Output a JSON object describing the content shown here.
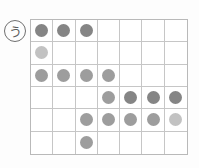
{
  "figure": {
    "label": {
      "text": "う",
      "style": "circled"
    },
    "grid": {
      "columns": 7,
      "rows": 6,
      "border_color": "#b9b9b9",
      "line_color": "#c6c6c6",
      "background": "#ffffff"
    },
    "dot_colors": {
      "dark": "#858585",
      "mid": "#9d9d9d",
      "light": "#c2c2c2"
    },
    "cells": [
      [
        {
          "dot": true,
          "shade": "dark"
        },
        {
          "dot": true,
          "shade": "dark"
        },
        {
          "dot": true,
          "shade": "dark"
        },
        {
          "dot": false,
          "shade": null
        },
        {
          "dot": false,
          "shade": null
        },
        {
          "dot": false,
          "shade": null
        },
        {
          "dot": false,
          "shade": null
        }
      ],
      [
        {
          "dot": true,
          "shade": "light"
        },
        {
          "dot": false,
          "shade": null
        },
        {
          "dot": false,
          "shade": null
        },
        {
          "dot": false,
          "shade": null
        },
        {
          "dot": false,
          "shade": null
        },
        {
          "dot": false,
          "shade": null
        },
        {
          "dot": false,
          "shade": null
        }
      ],
      [
        {
          "dot": true,
          "shade": "mid"
        },
        {
          "dot": true,
          "shade": "mid"
        },
        {
          "dot": true,
          "shade": "mid"
        },
        {
          "dot": true,
          "shade": "mid"
        },
        {
          "dot": false,
          "shade": null
        },
        {
          "dot": false,
          "shade": null
        },
        {
          "dot": false,
          "shade": null
        }
      ],
      [
        {
          "dot": false,
          "shade": null
        },
        {
          "dot": false,
          "shade": null
        },
        {
          "dot": false,
          "shade": null
        },
        {
          "dot": true,
          "shade": "mid"
        },
        {
          "dot": true,
          "shade": "dark"
        },
        {
          "dot": true,
          "shade": "dark"
        },
        {
          "dot": true,
          "shade": "dark"
        }
      ],
      [
        {
          "dot": false,
          "shade": null
        },
        {
          "dot": false,
          "shade": null
        },
        {
          "dot": true,
          "shade": "mid"
        },
        {
          "dot": true,
          "shade": "mid"
        },
        {
          "dot": true,
          "shade": "mid"
        },
        {
          "dot": true,
          "shade": "mid"
        },
        {
          "dot": true,
          "shade": "light"
        }
      ],
      [
        {
          "dot": false,
          "shade": null
        },
        {
          "dot": false,
          "shade": null
        },
        {
          "dot": true,
          "shade": "mid"
        },
        {
          "dot": false,
          "shade": null
        },
        {
          "dot": false,
          "shade": null
        },
        {
          "dot": false,
          "shade": null
        },
        {
          "dot": false,
          "shade": null
        }
      ]
    ],
    "row_dot_counts": [
      3,
      1,
      4,
      4,
      5,
      1
    ],
    "total_dots": 18
  }
}
